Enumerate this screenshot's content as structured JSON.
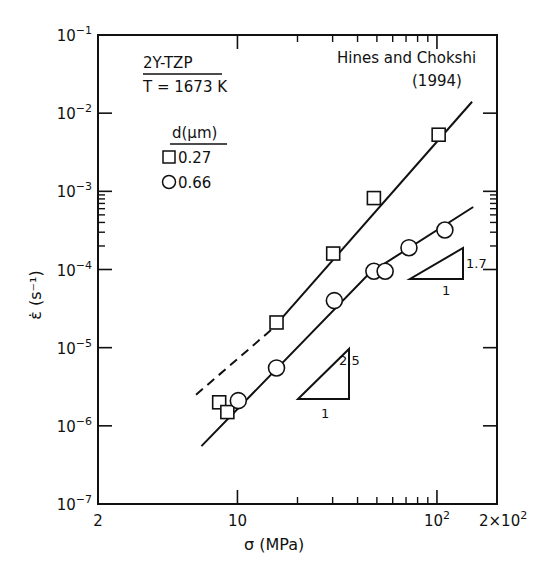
{
  "chart_data": {
    "type": "scatter",
    "title": "",
    "xlabel": "σ (MPa)",
    "ylabel": "ε̇ (s⁻¹)",
    "xscale": "log",
    "yscale": "log",
    "xlim": [
      2,
      200
    ],
    "ylim": [
      1e-07,
      0.1
    ],
    "x_tick_labels": [
      {
        "value": 2,
        "label": "2"
      },
      {
        "value": 10,
        "label": "10"
      },
      {
        "value": 100,
        "label": "10",
        "sup": "2"
      },
      {
        "value": 200,
        "label": "2×10",
        "sup": "2"
      }
    ],
    "y_tick_labels": [
      {
        "value": 0.1,
        "exp": "-1"
      },
      {
        "value": 0.01,
        "exp": "-2"
      },
      {
        "value": 0.001,
        "exp": "-3"
      },
      {
        "value": 0.0001,
        "exp": "-4"
      },
      {
        "value": 1e-05,
        "exp": "-5"
      },
      {
        "value": 1e-06,
        "exp": "-6"
      },
      {
        "value": 1e-07,
        "exp": "-7"
      }
    ],
    "grid": false,
    "annotations": {
      "material": "2Y-TZP",
      "temperature": "T = 1673 K",
      "source": "Hines and Chokshi",
      "year": "(1994)",
      "legend_title": "d(μm)",
      "slope_high": {
        "rise": "2.5",
        "run": "1"
      },
      "slope_low": {
        "rise": "1.7",
        "run": "1"
      }
    },
    "legend_position": "upper-left",
    "series": [
      {
        "name": "0.27",
        "marker": "square",
        "points": [
          {
            "x": 8.1,
            "y": 2e-06
          },
          {
            "x": 8.9,
            "y": 1.5e-06
          },
          {
            "x": 15.7,
            "y": 2.1e-05
          },
          {
            "x": 30.2,
            "y": 0.00016
          },
          {
            "x": 48.3,
            "y": 0.00082
          },
          {
            "x": 102,
            "y": 0.0053
          }
        ],
        "fit_line": {
          "slope": 2.5,
          "solid_from": [
            15.0,
            1.75e-05
          ],
          "solid_to": [
            150,
            0.014
          ],
          "dashed_from": [
            6.2,
            2.5e-06
          ]
        }
      },
      {
        "name": "0.66",
        "marker": "circle",
        "points": [
          {
            "x": 10.1,
            "y": 2.1e-06
          },
          {
            "x": 15.7,
            "y": 5.5e-06
          },
          {
            "x": 30.6,
            "y": 4e-05
          },
          {
            "x": 48.3,
            "y": 9.5e-05
          },
          {
            "x": 55,
            "y": 9.5e-05
          },
          {
            "x": 72.4,
            "y": 0.00019
          },
          {
            "x": 109.6,
            "y": 0.00032
          }
        ],
        "fit_line": {
          "breakpoint": [
            46,
            9e-05
          ],
          "slope_low_sigma": 2.5,
          "slope_high_sigma": 1.7,
          "from": [
            6.6,
            5.5e-07
          ],
          "to": [
            152,
            0.00063
          ]
        }
      }
    ]
  }
}
